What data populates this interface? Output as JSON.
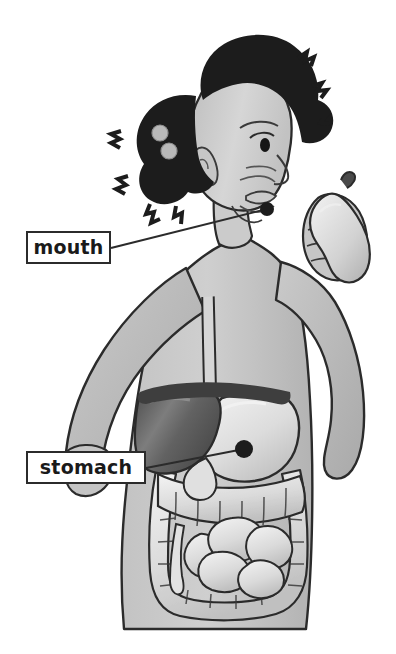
{
  "figure": {
    "view": "side profile, torso cutaway"
  },
  "labels": [
    {
      "id": "mouth",
      "text": "mouth",
      "box": {
        "x": 26,
        "y": 231,
        "w": 85,
        "h": 33
      },
      "leader": {
        "from_x": 111,
        "from_y": 248,
        "to_x": 267,
        "to_y": 209
      },
      "marker": {
        "x": 267,
        "y": 209,
        "r": 7
      }
    },
    {
      "id": "stomach",
      "text": "stomach",
      "box": {
        "x": 26,
        "y": 451,
        "w": 120,
        "h": 33
      },
      "leader": {
        "from_x": 146,
        "from_y": 468,
        "to_x": 244,
        "to_y": 449
      },
      "marker": {
        "x": 244,
        "y": 449,
        "r": 9
      }
    }
  ],
  "organs": [
    {
      "name": "esophagus"
    },
    {
      "name": "stomach"
    },
    {
      "name": "liver"
    },
    {
      "name": "small-intestine"
    },
    {
      "name": "large-intestine"
    },
    {
      "name": "appendix"
    }
  ],
  "objects": [
    {
      "name": "pear"
    },
    {
      "name": "hair-bead-upper"
    },
    {
      "name": "hair-bead-lower"
    }
  ],
  "colors": {
    "background": "#ffffff",
    "outline": "#2b2b2b",
    "label_border": "#2b2b2b",
    "label_text": "#1a1a1a",
    "skin_light": "#d3d3d3",
    "skin_mid": "#bdbdbd",
    "skin_shadow": "#a8a8a8",
    "hair": "#1c1c1c",
    "liver_dark": "#565656",
    "liver_mid": "#6e6e6e",
    "organ_light": "#e9e9e9",
    "organ_mid": "#cfcfcf",
    "pear": "#d8d8d8"
  }
}
